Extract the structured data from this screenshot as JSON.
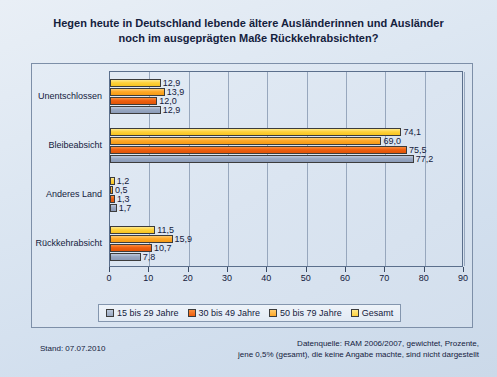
{
  "title": {
    "line1": "Hegen heute in Deutschland lebende ältere Ausländerinnen und Ausländer",
    "line2": "noch im ausgeprägten Maße Rückkehrabsichten?"
  },
  "footer": {
    "stand": "Stand: 07.07.2010",
    "source_line1": "Datenquelle: RAM 2006/2007, gewichtet, Prozente,",
    "source_line2": "jene 0,5% (gesamt), die keine Angabe machte, sind nicht dargestellt"
  },
  "chart_data": {
    "type": "bar",
    "orientation": "horizontal",
    "title": "Hegen heute in Deutschland lebende ältere Ausländerinnen und Ausländer noch im ausgeprägten Maße Rückkehrabsichten?",
    "xlabel": "",
    "ylabel": "",
    "xlim": [
      0,
      90
    ],
    "xticks": [
      "0",
      "10",
      "20",
      "30",
      "40",
      "50",
      "60",
      "70",
      "80",
      "90"
    ],
    "xtick_values": [
      0,
      10,
      20,
      30,
      40,
      50,
      60,
      70,
      80,
      90
    ],
    "grid": true,
    "legend_position": "bottom",
    "categories": [
      "Unentschlossen",
      "Bleibeabsicht",
      "Anderes Land",
      "Rückkehrabsicht"
    ],
    "series": [
      {
        "name": "Gesamt",
        "color": "#ffd23e",
        "values": [
          12.9,
          74.1,
          1.2,
          11.5
        ],
        "labels": [
          "12,9",
          "74,1",
          "1,2",
          "11,5"
        ]
      },
      {
        "name": "50 bis 79 Jahre",
        "color": "#ffa828",
        "values": [
          13.9,
          69.0,
          0.5,
          15.9
        ],
        "labels": [
          "13,9",
          "69,0",
          "0,5",
          "15,9"
        ]
      },
      {
        "name": "30 bis 49 Jahre",
        "color": "#ef5f10",
        "values": [
          12.0,
          75.5,
          1.3,
          10.7
        ],
        "labels": [
          "12,0",
          "75,5",
          "1,3",
          "10,7"
        ]
      },
      {
        "name": "15 bis 29 Jahre",
        "color": "#98a7c1",
        "values": [
          12.9,
          77.2,
          1.7,
          7.8
        ],
        "labels": [
          "12,9",
          "77,2",
          "1,7",
          "7,8"
        ]
      }
    ],
    "legend_entries": [
      {
        "label": "15 bis 29 Jahre",
        "color": "#98a7c1"
      },
      {
        "label": "30 bis 49 Jahre",
        "color": "#ef5f10"
      },
      {
        "label": "50 bis 79 Jahre",
        "color": "#ffa828"
      },
      {
        "label": "Gesamt",
        "color": "#ffd23e"
      }
    ]
  }
}
